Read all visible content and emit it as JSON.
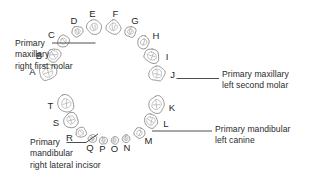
{
  "diagram": {
    "background_color": "#ffffff",
    "text_color": "#2b2b2b",
    "tooth_stroke_color": "#8e8e8e",
    "leader_color": "#3a3a3a"
  },
  "upper_arch": {
    "name": "maxillary-arch",
    "letters": [
      "A",
      "B",
      "C",
      "D",
      "E",
      "F",
      "G",
      "H",
      "I",
      "J"
    ]
  },
  "lower_arch": {
    "name": "mandibular-arch",
    "letters": [
      "K",
      "L",
      "M",
      "N",
      "O",
      "P",
      "Q",
      "R",
      "S",
      "T"
    ]
  },
  "teeth": [
    {
      "letter": "A",
      "arch": "maxillary",
      "side": "right",
      "type": "second-molar",
      "cx": 48.0,
      "cy": 72.5,
      "rx": 9.4,
      "ry": 8.2,
      "rot": -8,
      "label_x": 32.5,
      "label_y": 72.5
    },
    {
      "letter": "B",
      "arch": "maxillary",
      "side": "right",
      "type": "first-molar",
      "cx": 53.5,
      "cy": 55.0,
      "rx": 8.0,
      "ry": 7.2,
      "rot": -16,
      "label_x": 39.0,
      "label_y": 56.0
    },
    {
      "letter": "C",
      "arch": "maxillary",
      "side": "right",
      "type": "canine",
      "cx": 63.5,
      "cy": 41.0,
      "rx": 6.2,
      "ry": 6.6,
      "rot": -28,
      "label_x": 51.5,
      "label_y": 35.0
    },
    {
      "letter": "D",
      "arch": "maxillary",
      "side": "right",
      "type": "lateral-incisor",
      "cx": 77.5,
      "cy": 31.5,
      "rx": 5.6,
      "ry": 5.6,
      "rot": -20,
      "label_x": 74.0,
      "label_y": 21.0
    },
    {
      "letter": "E",
      "arch": "maxillary",
      "side": "right",
      "type": "central-incisor",
      "cx": 94.0,
      "cy": 27.0,
      "rx": 7.4,
      "ry": 7.4,
      "rot": -8,
      "label_x": 92.5,
      "label_y": 14.5
    },
    {
      "letter": "F",
      "arch": "maxillary",
      "side": "left",
      "type": "central-incisor",
      "cx": 113.5,
      "cy": 27.0,
      "rx": 7.4,
      "ry": 7.4,
      "rot": 8,
      "label_x": 115.5,
      "label_y": 14.5
    },
    {
      "letter": "G",
      "arch": "maxillary",
      "side": "left",
      "type": "lateral-incisor",
      "cx": 130.5,
      "cy": 31.5,
      "rx": 5.8,
      "ry": 5.8,
      "rot": 20,
      "label_x": 135.0,
      "label_y": 21.5
    },
    {
      "letter": "H",
      "arch": "maxillary",
      "side": "left",
      "type": "canine",
      "cx": 143.5,
      "cy": 42.0,
      "rx": 6.2,
      "ry": 6.6,
      "rot": 30,
      "label_x": 156.0,
      "label_y": 36.5
    },
    {
      "letter": "I",
      "arch": "maxillary",
      "side": "left",
      "type": "first-molar",
      "cx": 152.0,
      "cy": 56.0,
      "rx": 8.0,
      "ry": 7.2,
      "rot": 18,
      "label_x": 167.0,
      "label_y": 57.0
    },
    {
      "letter": "J",
      "arch": "maxillary",
      "side": "left",
      "type": "second-molar",
      "cx": 157.0,
      "cy": 73.5,
      "rx": 8.8,
      "ry": 7.8,
      "rot": 8,
      "label_x": 172.5,
      "label_y": 75.0
    },
    {
      "letter": "K",
      "arch": "mandibular",
      "side": "left",
      "type": "second-molar",
      "cx": 156.5,
      "cy": 104.5,
      "rx": 8.6,
      "ry": 8.8,
      "rot": 6,
      "label_x": 172.0,
      "label_y": 108.0
    },
    {
      "letter": "L",
      "arch": "mandibular",
      "side": "left",
      "type": "first-molar",
      "cx": 151.0,
      "cy": 121.0,
      "rx": 7.6,
      "ry": 7.4,
      "rot": 16,
      "label_x": 166.0,
      "label_y": 124.5
    },
    {
      "letter": "M",
      "arch": "mandibular",
      "side": "left",
      "type": "canine",
      "cx": 139.5,
      "cy": 133.0,
      "rx": 5.6,
      "ry": 5.4,
      "rot": 34,
      "label_x": 148.5,
      "label_y": 141.5
    },
    {
      "letter": "N",
      "arch": "mandibular",
      "side": "left",
      "type": "lateral-incisor",
      "cx": 126.0,
      "cy": 138.5,
      "rx": 4.2,
      "ry": 4.0,
      "rot": 18,
      "label_x": 127.0,
      "label_y": 148.0
    },
    {
      "letter": "O",
      "arch": "mandibular",
      "side": "left",
      "type": "central-incisor",
      "cx": 114.5,
      "cy": 140.5,
      "rx": 4.0,
      "ry": 3.9,
      "rot": 6,
      "label_x": 114.5,
      "label_y": 149.0
    },
    {
      "letter": "P",
      "arch": "mandibular",
      "side": "right",
      "type": "central-incisor",
      "cx": 103.5,
      "cy": 140.5,
      "rx": 4.0,
      "ry": 3.9,
      "rot": -6,
      "label_x": 102.5,
      "label_y": 149.0
    },
    {
      "letter": "Q",
      "arch": "mandibular",
      "side": "right",
      "type": "lateral-incisor",
      "cx": 92.5,
      "cy": 138.5,
      "rx": 4.2,
      "ry": 4.0,
      "rot": -18,
      "label_x": 90.0,
      "label_y": 148.5
    },
    {
      "letter": "R",
      "arch": "mandibular",
      "side": "right",
      "type": "canine",
      "cx": 81.0,
      "cy": 132.5,
      "rx": 5.6,
      "ry": 5.4,
      "rot": -34,
      "label_x": 69.5,
      "label_y": 138.5
    },
    {
      "letter": "S",
      "arch": "mandibular",
      "side": "right",
      "type": "first-molar",
      "cx": 71.0,
      "cy": 120.0,
      "rx": 7.6,
      "ry": 7.4,
      "rot": -16,
      "label_x": 56.0,
      "label_y": 123.0
    },
    {
      "letter": "T",
      "arch": "mandibular",
      "side": "right",
      "type": "second-molar",
      "cx": 66.0,
      "cy": 103.5,
      "rx": 8.4,
      "ry": 8.8,
      "rot": -6,
      "label_x": 50.5,
      "label_y": 106.0
    }
  ],
  "callouts": [
    {
      "id": "maxillary-right-first-molar",
      "text": "Primary\nmaxillary\nright first molar",
      "first_line": "Primary",
      "target_letter": "B",
      "leader": {
        "x1": 52.0,
        "y1": 43.0,
        "x2": 95.5,
        "y2": 43.0
      }
    },
    {
      "id": "maxillary-left-second-molar",
      "text": "Primary maxillary\nleft second molar",
      "first_line": "Primary maxillary",
      "target_letter": "J",
      "leader": {
        "x1": 176.5,
        "y1": 78.5,
        "x2": 219.0,
        "y2": 78.5
      }
    },
    {
      "id": "mandibular-left-canine",
      "text": "Primary mandibular\nleft canine",
      "first_line": "Primary mandibular",
      "target_letter": "M",
      "leader": {
        "x1": 152.0,
        "y1": 131.0,
        "x2": 212.0,
        "y2": 131.0
      }
    },
    {
      "id": "mandibular-right-lateral-incisor",
      "text": "Primary\nmandibular\nright lateral incisor",
      "first_line": "Primary",
      "target_letter": "Q",
      "leader_path": "M 66.5,142.5 L 86.0,142.5 L 98.0,134.0"
    }
  ]
}
